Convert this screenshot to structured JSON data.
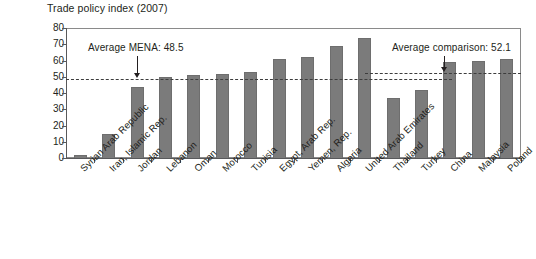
{
  "chart_data": {
    "type": "bar",
    "title": "Trade policy index (2007)",
    "xlabel": "",
    "ylabel": "",
    "ylim": [
      0,
      80
    ],
    "ytick_values": [
      0,
      10,
      20,
      30,
      40,
      50,
      60,
      70,
      80
    ],
    "ytick_labels": [
      "0",
      "10",
      "20",
      "30",
      "40",
      "50",
      "60",
      "70",
      "80"
    ],
    "grid": false,
    "legend": "none",
    "bar_color": "#7b7b7b",
    "categories": [
      "Syrian Arab Republic",
      "Iran, Islamic Rep.",
      "Jordan",
      "Lebanon",
      "Oman",
      "Morocco",
      "Tunisia",
      "Egypt, Arab Rep.",
      "Yemen, Rep.",
      "Algeria",
      "United Arab Emirates",
      "Thailand",
      "Turkey",
      "China",
      "Malaysia",
      "Poland"
    ],
    "values": [
      2,
      15,
      44,
      50,
      51,
      52,
      53,
      61,
      62,
      69,
      74,
      37,
      42,
      59,
      60,
      61
    ],
    "annotations": [
      {
        "id": "mena-average",
        "text": "Average MENA: 48.5",
        "value": 48.5,
        "line_color": "#3d3d3d",
        "line_style": "dashed"
      },
      {
        "id": "comparison-average",
        "text": "Average comparison: 52.1",
        "value": 52.1,
        "line_color": "#3d3d3d",
        "line_style": "dashed"
      }
    ]
  },
  "chart": {
    "title": "Trade policy index (2007)",
    "mena_annotation_label": "Average MENA: 48.5",
    "comparison_annotation_label": "Average comparison: 52.1"
  },
  "ytick_labels": {
    "t0": "0",
    "t1": "10",
    "t2": "20",
    "t3": "30",
    "t4": "40",
    "t5": "50",
    "t6": "60",
    "t7": "70",
    "t8": "80"
  },
  "categories": {
    "c0": "Syrian Arab Republic",
    "c1": "Iran, Islamic Rep.",
    "c2": "Jordan",
    "c3": "Lebanon",
    "c4": "Oman",
    "c5": "Morocco",
    "c6": "Tunisia",
    "c7": "Egypt, Arab Rep.",
    "c8": "Yemen, Rep.",
    "c9": "Algeria",
    "c10": "United Arab Emirates",
    "c11": "Thailand",
    "c12": "Turkey",
    "c13": "China",
    "c14": "Malaysia",
    "c15": "Poland"
  }
}
